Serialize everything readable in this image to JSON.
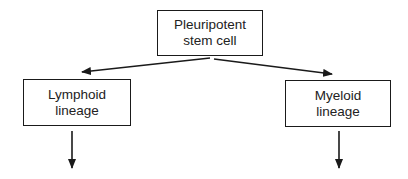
{
  "diagram": {
    "type": "flowchart",
    "nodes": [
      {
        "id": "root",
        "line1": "Pleuripotent",
        "line2": "stem cell"
      },
      {
        "id": "lymphoid",
        "line1": "Lymphoid",
        "line2": "lineage"
      },
      {
        "id": "myeloid",
        "line1": "Myeloid",
        "line2": "lineage"
      }
    ],
    "edges": [
      {
        "from": "root",
        "to": "lymphoid"
      },
      {
        "from": "root",
        "to": "myeloid"
      },
      {
        "from": "lymphoid",
        "to": "(continues below)"
      },
      {
        "from": "myeloid",
        "to": "(continues below)"
      }
    ],
    "colors": {
      "stroke": "#1a1a1a",
      "background": "#ffffff",
      "text": "#222222"
    }
  }
}
